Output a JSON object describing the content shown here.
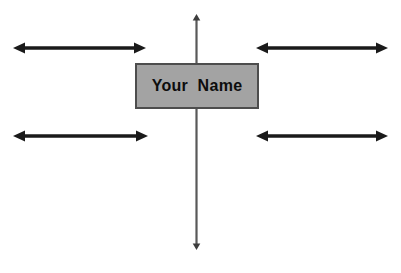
{
  "diagram": {
    "type": "spider-web-brainstorm-template",
    "background_color": "#ffffff",
    "center_node": {
      "label": "Your  Name",
      "fill_color": "#a3a3a3",
      "border_color": "#4d4d4d",
      "text_color": "#0d0d0d"
    },
    "axis": {
      "name": "vertical-axis",
      "color": "#595959",
      "orientation": "vertical",
      "arrowheads": "both"
    },
    "branches": [
      {
        "id": "branch-top-left",
        "position": "top-left",
        "label": "",
        "color": "#1a1a1a",
        "arrowheads": "both"
      },
      {
        "id": "branch-top-right",
        "position": "top-right",
        "label": "",
        "color": "#1a1a1a",
        "arrowheads": "both"
      },
      {
        "id": "branch-bottom-left",
        "position": "bottom-left",
        "label": "",
        "color": "#1a1a1a",
        "arrowheads": "both"
      },
      {
        "id": "branch-bottom-right",
        "position": "bottom-right",
        "label": "",
        "color": "#1a1a1a",
        "arrowheads": "both"
      }
    ]
  }
}
